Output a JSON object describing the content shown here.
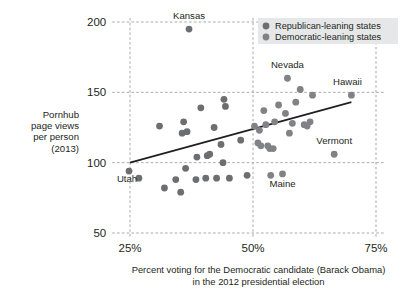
{
  "chart_data": {
    "type": "scatter",
    "title": "",
    "xlabel": "Percent voting for the Democratic candidate (Barack Obama) in the 2012 presidential election",
    "xlabel_line1": "Percent voting for the Democratic candidate (Barack Obama)",
    "xlabel_line2": "in the 2012 presidential election",
    "ylabel": "Pornhub page views per person (2013)",
    "ylabel_lines": [
      "Pornhub",
      "page views",
      "per person",
      "(2013)"
    ],
    "xlim": [
      22,
      77
    ],
    "ylim": [
      50,
      200
    ],
    "xticks": [
      25,
      50,
      75
    ],
    "xticklabels": [
      "25%",
      "50%",
      "75%"
    ],
    "yticks": [
      50,
      100,
      150,
      200
    ],
    "yticklabels": [
      "50",
      "100",
      "150",
      "200"
    ],
    "grid": true,
    "grid_style": "dashed",
    "legend_position": "top-right",
    "legend": [
      {
        "name": "Republican-leaning states",
        "marker": "circle",
        "color": "#6d6e71"
      },
      {
        "name": "Democratic-leaning states",
        "marker": "circle",
        "color": "#808285"
      }
    ],
    "trendline": {
      "x0": 25,
      "y0": 100,
      "x1": 70,
      "y1": 143,
      "color": "#231f20"
    },
    "annotations": [
      {
        "text": "Kansas",
        "x": 37,
        "y": 195,
        "dx": 0,
        "dy": -10,
        "anchor": "middle"
      },
      {
        "text": "Nevada",
        "x": 57,
        "y": 160,
        "dx": 0,
        "dy": -10,
        "anchor": "middle"
      },
      {
        "text": "Hawaii",
        "x": 70,
        "y": 148,
        "dx": -4,
        "dy": -10,
        "anchor": "middle"
      },
      {
        "text": "Vermont",
        "x": 66.5,
        "y": 106,
        "dx": 0,
        "dy": -10,
        "anchor": "middle"
      },
      {
        "text": "Utah",
        "x": 24.8,
        "y": 94,
        "dx": -2,
        "dy": 11,
        "anchor": "middle"
      },
      {
        "text": "Maine",
        "x": 56,
        "y": 92,
        "dx": 0,
        "dy": 13,
        "anchor": "middle"
      }
    ],
    "series": [
      {
        "name": "Republican-leaning states",
        "color": "#6d6e71",
        "points": [
          {
            "x": 24.8,
            "y": 94,
            "label": "Utah"
          },
          {
            "x": 26.8,
            "y": 89
          },
          {
            "x": 31.0,
            "y": 126
          },
          {
            "x": 32.0,
            "y": 82
          },
          {
            "x": 34.3,
            "y": 88
          },
          {
            "x": 35.3,
            "y": 79
          },
          {
            "x": 35.6,
            "y": 121
          },
          {
            "x": 35.9,
            "y": 129
          },
          {
            "x": 36.3,
            "y": 96
          },
          {
            "x": 36.6,
            "y": 122
          },
          {
            "x": 37.0,
            "y": 195,
            "label": "Kansas"
          },
          {
            "x": 38.4,
            "y": 88
          },
          {
            "x": 38.6,
            "y": 104
          },
          {
            "x": 39.4,
            "y": 139
          },
          {
            "x": 40.4,
            "y": 89
          },
          {
            "x": 40.7,
            "y": 105
          },
          {
            "x": 41.2,
            "y": 106
          },
          {
            "x": 42.1,
            "y": 125
          },
          {
            "x": 42.6,
            "y": 89
          },
          {
            "x": 43.5,
            "y": 113
          },
          {
            "x": 43.9,
            "y": 100
          },
          {
            "x": 44.1,
            "y": 145
          },
          {
            "x": 44.4,
            "y": 140
          },
          {
            "x": 45.2,
            "y": 89
          },
          {
            "x": 47.5,
            "y": 116
          },
          {
            "x": 48.8,
            "y": 91
          }
        ]
      },
      {
        "name": "Democratic-leaning states",
        "color": "#808285",
        "points": [
          {
            "x": 50.3,
            "y": 126
          },
          {
            "x": 51.0,
            "y": 114
          },
          {
            "x": 51.3,
            "y": 123
          },
          {
            "x": 51.6,
            "y": 112
          },
          {
            "x": 52.2,
            "y": 137
          },
          {
            "x": 52.6,
            "y": 127
          },
          {
            "x": 53.0,
            "y": 112
          },
          {
            "x": 53.4,
            "y": 110
          },
          {
            "x": 53.6,
            "y": 91
          },
          {
            "x": 54.1,
            "y": 110
          },
          {
            "x": 54.4,
            "y": 129
          },
          {
            "x": 55.2,
            "y": 141
          },
          {
            "x": 56.0,
            "y": 92,
            "label": "Maine"
          },
          {
            "x": 56.6,
            "y": 135
          },
          {
            "x": 57.0,
            "y": 160,
            "label": "Nevada"
          },
          {
            "x": 57.4,
            "y": 121
          },
          {
            "x": 58.0,
            "y": 128
          },
          {
            "x": 58.7,
            "y": 143
          },
          {
            "x": 59.6,
            "y": 152
          },
          {
            "x": 60.4,
            "y": 127
          },
          {
            "x": 61.0,
            "y": 126
          },
          {
            "x": 61.6,
            "y": 129
          },
          {
            "x": 62.1,
            "y": 148
          },
          {
            "x": 66.5,
            "y": 106,
            "label": "Vermont"
          },
          {
            "x": 70.0,
            "y": 148,
            "label": "Hawaii"
          }
        ]
      }
    ]
  },
  "figure": {
    "bg_color": "#ffffff",
    "grid_color": "#a7a9ac",
    "legend_bg": "#e6e7e8",
    "text_color": "#231f20"
  }
}
